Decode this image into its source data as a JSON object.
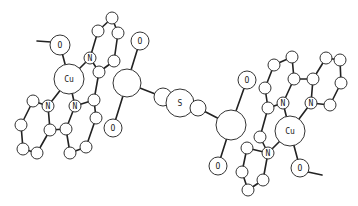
{
  "diagram": {
    "background": "#ffffff",
    "stroke_color": "#222222",
    "labels": {
      "cu_left": "Cu",
      "cu_right": "Cu",
      "n": "N",
      "o": "O",
      "s": "S"
    },
    "atoms": [
      {
        "id": "L_O_me",
        "x": 60,
        "y": 45,
        "r": 10,
        "label": "O"
      },
      {
        "id": "L_Cu",
        "x": 69,
        "y": 79,
        "r": 15,
        "label": "Cu"
      },
      {
        "id": "L_N1",
        "x": 90,
        "y": 58,
        "r": 6,
        "label": "N"
      },
      {
        "id": "L_N2",
        "x": 48,
        "y": 106,
        "r": 6,
        "label": "N"
      },
      {
        "id": "L_N3",
        "x": 75,
        "y": 106,
        "r": 6,
        "label": "N"
      },
      {
        "id": "L_a1",
        "x": 112,
        "y": 18,
        "r": 6,
        "label": ""
      },
      {
        "id": "L_a2",
        "x": 98,
        "y": 31,
        "r": 6,
        "label": ""
      },
      {
        "id": "L_a3",
        "x": 118,
        "y": 33,
        "r": 6,
        "label": ""
      },
      {
        "id": "L_a4",
        "x": 114,
        "y": 61,
        "r": 6,
        "label": ""
      },
      {
        "id": "L_a5",
        "x": 99,
        "y": 72,
        "r": 6,
        "label": ""
      },
      {
        "id": "L_a6",
        "x": 94,
        "y": 100,
        "r": 6,
        "label": ""
      },
      {
        "id": "L_a7",
        "x": 96,
        "y": 118,
        "r": 6,
        "label": ""
      },
      {
        "id": "L_a8",
        "x": 86,
        "y": 147,
        "r": 6,
        "label": ""
      },
      {
        "id": "L_a9",
        "x": 70,
        "y": 153,
        "r": 6,
        "label": ""
      },
      {
        "id": "L_a10",
        "x": 66,
        "y": 129,
        "r": 6,
        "label": ""
      },
      {
        "id": "L_a11",
        "x": 50,
        "y": 130,
        "r": 6,
        "label": ""
      },
      {
        "id": "L_a12",
        "x": 33,
        "y": 101,
        "r": 6,
        "label": ""
      },
      {
        "id": "L_a13",
        "x": 21,
        "y": 125,
        "r": 6,
        "label": ""
      },
      {
        "id": "L_a14",
        "x": 23,
        "y": 149,
        "r": 6,
        "label": ""
      },
      {
        "id": "L_a15",
        "x": 37,
        "y": 153,
        "r": 6,
        "label": ""
      },
      {
        "id": "L_P",
        "x": 127,
        "y": 83,
        "r": 14,
        "label": ""
      },
      {
        "id": "L_O_top",
        "x": 140,
        "y": 41,
        "r": 9,
        "label": "O"
      },
      {
        "id": "L_O_bot",
        "x": 113,
        "y": 128,
        "r": 9,
        "label": "O"
      },
      {
        "id": "S_c1",
        "x": 163,
        "y": 97,
        "r": 9,
        "label": ""
      },
      {
        "id": "S",
        "x": 180,
        "y": 103,
        "r": 14,
        "label": "S"
      },
      {
        "id": "S_c2",
        "x": 198,
        "y": 108,
        "r": 8,
        "label": ""
      },
      {
        "id": "R_P",
        "x": 231,
        "y": 125,
        "r": 15,
        "label": ""
      },
      {
        "id": "R_O_top",
        "x": 247,
        "y": 80,
        "r": 9,
        "label": "O"
      },
      {
        "id": "R_O_bot",
        "x": 218,
        "y": 166,
        "r": 9,
        "label": "O"
      },
      {
        "id": "R_Cu",
        "x": 290,
        "y": 131,
        "r": 15,
        "label": "Cu"
      },
      {
        "id": "R_N1",
        "x": 283,
        "y": 103,
        "r": 6,
        "label": "N"
      },
      {
        "id": "R_N2",
        "x": 311,
        "y": 103,
        "r": 6,
        "label": "N"
      },
      {
        "id": "R_N3",
        "x": 268,
        "y": 153,
        "r": 6,
        "label": "N"
      },
      {
        "id": "R_O_me",
        "x": 300,
        "y": 168,
        "r": 9,
        "label": "O"
      },
      {
        "id": "R_b1",
        "x": 274,
        "y": 65,
        "r": 6,
        "label": ""
      },
      {
        "id": "R_b2",
        "x": 292,
        "y": 57,
        "r": 6,
        "label": ""
      },
      {
        "id": "R_b3",
        "x": 294,
        "y": 79,
        "r": 6,
        "label": ""
      },
      {
        "id": "R_b4",
        "x": 265,
        "y": 88,
        "r": 6,
        "label": ""
      },
      {
        "id": "R_b5",
        "x": 268,
        "y": 108,
        "r": 6,
        "label": ""
      },
      {
        "id": "R_b6",
        "x": 313,
        "y": 79,
        "r": 6,
        "label": ""
      },
      {
        "id": "R_b7",
        "x": 326,
        "y": 58,
        "r": 6,
        "label": ""
      },
      {
        "id": "R_b8",
        "x": 340,
        "y": 60,
        "r": 6,
        "label": ""
      },
      {
        "id": "R_b9",
        "x": 341,
        "y": 83,
        "r": 6,
        "label": ""
      },
      {
        "id": "R_b10",
        "x": 330,
        "y": 105,
        "r": 6,
        "label": ""
      },
      {
        "id": "R_b11",
        "x": 260,
        "y": 137,
        "r": 6,
        "label": ""
      },
      {
        "id": "R_b12",
        "x": 247,
        "y": 148,
        "r": 6,
        "label": ""
      },
      {
        "id": "R_b13",
        "x": 242,
        "y": 172,
        "r": 6,
        "label": ""
      },
      {
        "id": "R_b14",
        "x": 248,
        "y": 190,
        "r": 6,
        "label": ""
      },
      {
        "id": "R_b15",
        "x": 263,
        "y": 180,
        "r": 6,
        "label": ""
      }
    ],
    "bonds": [
      [
        "L_O_me",
        "L_Cu"
      ],
      [
        "L_Cu",
        "L_N1"
      ],
      [
        "L_Cu",
        "L_N2"
      ],
      [
        "L_Cu",
        "L_N3"
      ],
      [
        "L_N1",
        "L_a2"
      ],
      [
        "L_a2",
        "L_a1"
      ],
      [
        "L_a1",
        "L_a3"
      ],
      [
        "L_a3",
        "L_a4"
      ],
      [
        "L_a4",
        "L_a5"
      ],
      [
        "L_a5",
        "L_N1"
      ],
      [
        "L_a5",
        "L_a6"
      ],
      [
        "L_a6",
        "L_N3"
      ],
      [
        "L_a6",
        "L_a7"
      ],
      [
        "L_a7",
        "L_a8"
      ],
      [
        "L_a8",
        "L_a9"
      ],
      [
        "L_a9",
        "L_a10"
      ],
      [
        "L_a10",
        "L_N3"
      ],
      [
        "L_a10",
        "L_a11"
      ],
      [
        "L_a11",
        "L_N2"
      ],
      [
        "L_N2",
        "L_a12"
      ],
      [
        "L_a12",
        "L_a13"
      ],
      [
        "L_a13",
        "L_a14"
      ],
      [
        "L_a14",
        "L_a15"
      ],
      [
        "L_a15",
        "L_a11"
      ],
      [
        "L_P",
        "L_O_top"
      ],
      [
        "L_P",
        "L_O_bot"
      ],
      [
        "L_P",
        "S_c1"
      ],
      [
        "S_c1",
        "S"
      ],
      [
        "S",
        "S_c2"
      ],
      [
        "S_c2",
        "R_P"
      ],
      [
        "R_P",
        "R_O_top"
      ],
      [
        "R_P",
        "R_O_bot"
      ],
      [
        "R_Cu",
        "R_N1"
      ],
      [
        "R_Cu",
        "R_N2"
      ],
      [
        "R_Cu",
        "R_N3"
      ],
      [
        "R_Cu",
        "R_O_me"
      ],
      [
        "R_N1",
        "R_b5"
      ],
      [
        "R_b5",
        "R_b4"
      ],
      [
        "R_b4",
        "R_b1"
      ],
      [
        "R_b1",
        "R_b2"
      ],
      [
        "R_b2",
        "R_b3"
      ],
      [
        "R_b3",
        "R_N1"
      ],
      [
        "R_b3",
        "R_b6"
      ],
      [
        "R_b6",
        "R_N2"
      ],
      [
        "R_b6",
        "R_b7"
      ],
      [
        "R_b7",
        "R_b8"
      ],
      [
        "R_b8",
        "R_b9"
      ],
      [
        "R_b9",
        "R_b10"
      ],
      [
        "R_b10",
        "R_N2"
      ],
      [
        "R_b5",
        "R_b11"
      ],
      [
        "R_b11",
        "R_N3"
      ],
      [
        "R_N3",
        "R_b12"
      ],
      [
        "R_b12",
        "R_b13"
      ],
      [
        "R_b13",
        "R_b14"
      ],
      [
        "R_b14",
        "R_b15"
      ],
      [
        "R_b15",
        "R_N3"
      ]
    ],
    "methyl_lines": [
      {
        "x1": 37,
        "y1": 41,
        "x2": 51,
        "y2": 42
      },
      {
        "x1": 308,
        "y1": 172,
        "x2": 322,
        "y2": 175
      }
    ]
  }
}
